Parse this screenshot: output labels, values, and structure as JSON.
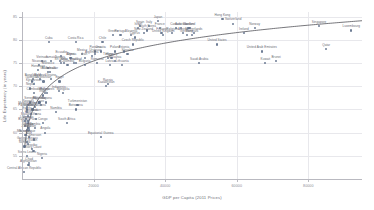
{
  "chart_data": {
    "type": "scatter",
    "title": "",
    "xlabel": "GDP per Capita (2011 Prices)",
    "ylabel": "Life Expectancy (in years)",
    "xlim": [
      0,
      95000
    ],
    "ylim": [
      50,
      86
    ],
    "xticks": [
      20000,
      40000,
      60000,
      80000
    ],
    "xtick_labels": [
      "20000",
      "40000",
      "60000",
      "80000"
    ],
    "yticks": [
      55,
      60,
      65,
      70,
      75,
      80,
      85
    ],
    "ytick_labels": [
      "55",
      "60",
      "65",
      "70",
      "75",
      "80",
      "85"
    ],
    "grid": true,
    "legend": "none",
    "point_color": "#5a6b86",
    "trend_color": "#3b3b42",
    "grid_color": "#e8e8ec",
    "trend": {
      "type": "log-fit",
      "description": "Preston curve: logarithmic fit of life expectancy on GDP per capita"
    },
    "points": [
      {
        "label": "Afghanistan",
        "x": 1800,
        "y": 53.0
      },
      {
        "label": "Central African Republic",
        "x": 600,
        "y": 51.5
      },
      {
        "label": "Chad",
        "x": 2000,
        "y": 53.5
      },
      {
        "label": "Nigeria",
        "x": 5600,
        "y": 54.5
      },
      {
        "label": "Sierra Leone",
        "x": 1400,
        "y": 55.0
      },
      {
        "label": "Ivory Coast",
        "x": 3200,
        "y": 56.0
      },
      {
        "label": "Lesotho",
        "x": 2700,
        "y": 56.5
      },
      {
        "label": "Somalia",
        "x": 700,
        "y": 57.0
      },
      {
        "label": "South Sudan",
        "x": 1700,
        "y": 57.5
      },
      {
        "label": "Guinea-Bissau",
        "x": 1500,
        "y": 58.0
      },
      {
        "label": "Cameroon",
        "x": 3300,
        "y": 58.5
      },
      {
        "label": "Mali",
        "x": 1900,
        "y": 59.0
      },
      {
        "label": "Burundi",
        "x": 750,
        "y": 59.5
      },
      {
        "label": "Mozambique",
        "x": 1150,
        "y": 59.5
      },
      {
        "label": "Equatorial Guinea",
        "x": 22000,
        "y": 59.0
      },
      {
        "label": "Angola",
        "x": 6500,
        "y": 60.0
      },
      {
        "label": "Togo",
        "x": 1450,
        "y": 60.5
      },
      {
        "label": "Zambia",
        "x": 3600,
        "y": 61.0
      },
      {
        "label": "Benin",
        "x": 2000,
        "y": 61.0
      },
      {
        "label": "Congo",
        "x": 5800,
        "y": 62.0
      },
      {
        "label": "Niger",
        "x": 900,
        "y": 61.5
      },
      {
        "label": "Burkina Faso",
        "x": 1600,
        "y": 62.0
      },
      {
        "label": "Liberia",
        "x": 800,
        "y": 62.5
      },
      {
        "label": "Uganda",
        "x": 1700,
        "y": 62.5
      },
      {
        "label": "Malawi",
        "x": 1100,
        "y": 63.0
      },
      {
        "label": "Haiti",
        "x": 1700,
        "y": 63.5
      },
      {
        "label": "Zimbabwe",
        "x": 1900,
        "y": 60.5
      },
      {
        "label": "Gambia",
        "x": 1600,
        "y": 61.0
      },
      {
        "label": "Ghana",
        "x": 4000,
        "y": 63.0
      },
      {
        "label": "Tanzania",
        "x": 2600,
        "y": 64.0
      },
      {
        "label": "Eritrea",
        "x": 1400,
        "y": 64.5
      },
      {
        "label": "Kenya",
        "x": 3000,
        "y": 65.0
      },
      {
        "label": "Ethiopia",
        "x": 1500,
        "y": 65.0
      },
      {
        "label": "Rwanda",
        "x": 1700,
        "y": 66.0
      },
      {
        "label": "Madagascar",
        "x": 1400,
        "y": 65.5
      },
      {
        "label": "Senegal",
        "x": 2300,
        "y": 66.5
      },
      {
        "label": "Papua New Guinea",
        "x": 2800,
        "y": 65.0
      },
      {
        "label": "Yemen",
        "x": 3600,
        "y": 65.5
      },
      {
        "label": "Laos",
        "x": 5200,
        "y": 66.0
      },
      {
        "label": "Sudan",
        "x": 4000,
        "y": 64.0
      },
      {
        "label": "Botswana",
        "x": 15000,
        "y": 65.0
      },
      {
        "label": "South Africa",
        "x": 12500,
        "y": 62.0
      },
      {
        "label": "Namibia",
        "x": 9500,
        "y": 64.5
      },
      {
        "label": "India",
        "x": 5800,
        "y": 68.0
      },
      {
        "label": "Myanmar",
        "x": 4900,
        "y": 66.5
      },
      {
        "label": "Pakistan",
        "x": 4700,
        "y": 66.5
      },
      {
        "label": "Nepal",
        "x": 2300,
        "y": 69.5
      },
      {
        "label": "Bangladesh",
        "x": 3100,
        "y": 71.5
      },
      {
        "label": "Cambodia",
        "x": 3300,
        "y": 68.5
      },
      {
        "label": "Bolivia",
        "x": 6400,
        "y": 68.5
      },
      {
        "label": "Philippines",
        "x": 6900,
        "y": 68.5
      },
      {
        "label": "Indonesia",
        "x": 10300,
        "y": 69.0
      },
      {
        "label": "Mongolia",
        "x": 11500,
        "y": 68.5
      },
      {
        "label": "Guyana",
        "x": 6800,
        "y": 66.5
      },
      {
        "label": "Turkmenistan",
        "x": 15500,
        "y": 66.0
      },
      {
        "label": "Kazakhstan",
        "x": 23500,
        "y": 70.0
      },
      {
        "label": "Russia",
        "x": 24000,
        "y": 70.5
      },
      {
        "label": "Ukraine",
        "x": 8000,
        "y": 71.5
      },
      {
        "label": "Moldova",
        "x": 5000,
        "y": 71.5
      },
      {
        "label": "Egypt",
        "x": 10500,
        "y": 71.0
      },
      {
        "label": "Uzbekistan",
        "x": 6000,
        "y": 71.0
      },
      {
        "label": "Kyrgyzstan",
        "x": 3300,
        "y": 70.5
      },
      {
        "label": "Tajikistan",
        "x": 2700,
        "y": 71.0
      },
      {
        "label": "Morocco",
        "x": 7300,
        "y": 74.0
      },
      {
        "label": "Guatemala",
        "x": 7300,
        "y": 73.0
      },
      {
        "label": "Honduras",
        "x": 4500,
        "y": 73.5
      },
      {
        "label": "Nicaragua",
        "x": 4800,
        "y": 74.5
      },
      {
        "label": "El Salvador",
        "x": 7800,
        "y": 73.0
      },
      {
        "label": "Jamaica",
        "x": 8200,
        "y": 75.5
      },
      {
        "label": "Vietnam",
        "x": 5600,
        "y": 75.5
      },
      {
        "label": "Sri Lanka",
        "x": 11000,
        "y": 75.0
      },
      {
        "label": "Peru",
        "x": 11700,
        "y": 75.0
      },
      {
        "label": "Colombia",
        "x": 12700,
        "y": 74.5
      },
      {
        "label": "Brazil",
        "x": 14500,
        "y": 75.0
      },
      {
        "label": "Thailand",
        "x": 15000,
        "y": 75.0
      },
      {
        "label": "China",
        "x": 13500,
        "y": 76.0
      },
      {
        "label": "Tunisia",
        "x": 10600,
        "y": 75.5
      },
      {
        "label": "Algeria",
        "x": 13800,
        "y": 76.0
      },
      {
        "label": "Mexico",
        "x": 16800,
        "y": 77.0
      },
      {
        "label": "Iran",
        "x": 17500,
        "y": 76.0
      },
      {
        "label": "Turkey",
        "x": 24000,
        "y": 76.0
      },
      {
        "label": "Ecuador",
        "x": 11000,
        "y": 76.5
      },
      {
        "label": "Panama",
        "x": 20500,
        "y": 77.5
      },
      {
        "label": "Costa Rica",
        "x": 15000,
        "y": 79.5
      },
      {
        "label": "Chile",
        "x": 22500,
        "y": 79.5
      },
      {
        "label": "Cuba",
        "x": 7500,
        "y": 79.5
      },
      {
        "label": "Uruguay",
        "x": 20500,
        "y": 77.0
      },
      {
        "label": "Argentina",
        "x": 19500,
        "y": 76.5
      },
      {
        "label": "Malaysia",
        "x": 26000,
        "y": 75.5
      },
      {
        "label": "Romania",
        "x": 21000,
        "y": 75.0
      },
      {
        "label": "Bulgaria",
        "x": 17500,
        "y": 74.5
      },
      {
        "label": "Hungary",
        "x": 25000,
        "y": 76.0
      },
      {
        "label": "Poland",
        "x": 26000,
        "y": 77.5
      },
      {
        "label": "Croatia",
        "x": 22000,
        "y": 77.5
      },
      {
        "label": "Estonia",
        "x": 28500,
        "y": 77.5
      },
      {
        "label": "Lithuania",
        "x": 28000,
        "y": 74.5
      },
      {
        "label": "Latvia",
        "x": 24500,
        "y": 74.5
      },
      {
        "label": "Slovakia",
        "x": 29500,
        "y": 77.0
      },
      {
        "label": "Czech Republic",
        "x": 31000,
        "y": 79.0
      },
      {
        "label": "Portugal",
        "x": 27500,
        "y": 81.0
      },
      {
        "label": "Greece",
        "x": 25500,
        "y": 81.0
      },
      {
        "label": "Slovenia",
        "x": 30500,
        "y": 81.0
      },
      {
        "label": "Cyprus",
        "x": 31500,
        "y": 80.5
      },
      {
        "label": "South Korea",
        "x": 35000,
        "y": 82.0
      },
      {
        "label": "Spain",
        "x": 33000,
        "y": 83.0
      },
      {
        "label": "Italy",
        "x": 35500,
        "y": 83.0
      },
      {
        "label": "Israel",
        "x": 32500,
        "y": 82.5
      },
      {
        "label": "France",
        "x": 38500,
        "y": 82.5
      },
      {
        "label": "Japan",
        "x": 38000,
        "y": 84.0
      },
      {
        "label": "United Kingdom",
        "x": 39500,
        "y": 81.0
      },
      {
        "label": "Finland",
        "x": 39000,
        "y": 81.5
      },
      {
        "label": "New Zealand",
        "x": 34000,
        "y": 81.5
      },
      {
        "label": "Belgium",
        "x": 42000,
        "y": 81.5
      },
      {
        "label": "Canada",
        "x": 43000,
        "y": 82.5
      },
      {
        "label": "Austria",
        "x": 45000,
        "y": 81.5
      },
      {
        "label": "Australia",
        "x": 44500,
        "y": 82.5
      },
      {
        "label": "Germany",
        "x": 46000,
        "y": 81.0
      },
      {
        "label": "Sweden",
        "x": 46500,
        "y": 82.5
      },
      {
        "label": "Denmark",
        "x": 47500,
        "y": 81.0
      },
      {
        "label": "Netherlands",
        "x": 48000,
        "y": 81.5
      },
      {
        "label": "Iceland",
        "x": 47000,
        "y": 82.5
      },
      {
        "label": "Switzerland",
        "x": 59000,
        "y": 83.5
      },
      {
        "label": "Norway",
        "x": 65000,
        "y": 82.5
      },
      {
        "label": "Ireland",
        "x": 62000,
        "y": 81.5
      },
      {
        "label": "United States",
        "x": 54500,
        "y": 79.0
      },
      {
        "label": "United Arab Emirates",
        "x": 67000,
        "y": 77.5
      },
      {
        "label": "Saudi Arabia",
        "x": 49500,
        "y": 75.0
      },
      {
        "label": "Kuwait",
        "x": 68000,
        "y": 75.0
      },
      {
        "label": "Brunei",
        "x": 71000,
        "y": 75.5
      },
      {
        "label": "Qatar",
        "x": 85000,
        "y": 78.0
      },
      {
        "label": "Singapore",
        "x": 83000,
        "y": 83.0
      },
      {
        "label": "Luxembourg",
        "x": 92000,
        "y": 82.0
      },
      {
        "label": "Hong Kong",
        "x": 56000,
        "y": 84.5
      }
    ]
  }
}
